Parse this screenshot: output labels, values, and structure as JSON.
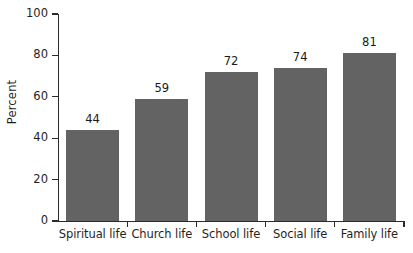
{
  "chart_data": {
    "type": "bar",
    "title": "",
    "subtitle": "",
    "xlabel": "",
    "ylabel": "Percent",
    "categories": [
      "Spiritual life",
      "Church life",
      "School life",
      "Social life",
      "Family life"
    ],
    "values": [
      44,
      59,
      72,
      74,
      81
    ],
    "value_labels": [
      "44",
      "59",
      "72",
      "74",
      "81"
    ],
    "ylim": [
      0,
      100
    ],
    "y_ticks": [
      0,
      20,
      40,
      60,
      80,
      100
    ],
    "y_tick_labels": [
      "0",
      "20",
      "40",
      "60",
      "80",
      "100"
    ],
    "grid": false,
    "legend": false,
    "legend_position": "none",
    "bar_color": "#636363",
    "axis_color": "#2b2b2b",
    "background_color": "#ffffff",
    "text_color": "#1a1a1a"
  }
}
